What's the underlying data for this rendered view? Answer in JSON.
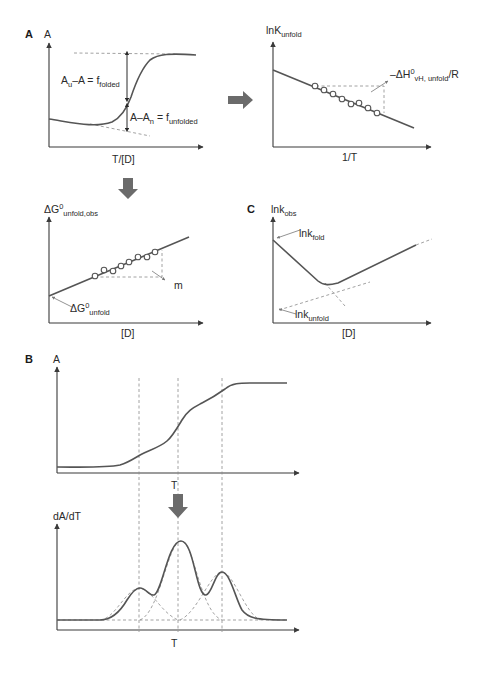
{
  "figure": {
    "panel_labels": {
      "a": "A",
      "b": "B",
      "c": "C"
    },
    "arrow_color": "#6b6b6b",
    "line_color": "#555555",
    "dash_color": "#8a8a8a"
  },
  "panel_a_melt": {
    "y_label": "A",
    "x_label": "T/[D]",
    "annot_folded_main": "A",
    "annot_folded_sub1": "u",
    "annot_folded_mid": "–A = f",
    "annot_folded_sub2": "folded",
    "annot_unfolded_main": "A–A",
    "annot_unfolded_sub1": "n",
    "annot_unfolded_mid": " = f",
    "annot_unfolded_sub2": "unfolded"
  },
  "panel_a_vanthoff": {
    "y_label_main": "lnK",
    "y_label_sub": "unfold",
    "x_label": "1/T",
    "slope_label_main": "–ΔH",
    "slope_label_sup": "0",
    "slope_label_sub": "vH, unfold",
    "slope_label_tail": "/R",
    "points": 8
  },
  "panel_a_denaturant": {
    "y_label_main": "ΔG",
    "y_label_sup": "0",
    "y_label_sub": "unfold,obs",
    "x_label": "[D]",
    "intercept_main": "ΔG",
    "intercept_sup": "0",
    "intercept_sub": "unfold",
    "slope_label": "m",
    "points": 8
  },
  "panel_c_chevron": {
    "y_label_main": "lnk",
    "y_label_sub": "obs",
    "x_label": "[D]",
    "fold_label_main": "lnk",
    "fold_label_sub": "fold",
    "unfold_label_main": "lnk",
    "unfold_label_sub": "unfold"
  },
  "panel_b_melt": {
    "y_label": "A",
    "x_label": "T"
  },
  "panel_b_derivative": {
    "y_label": "dA/dT",
    "x_label": "T"
  }
}
